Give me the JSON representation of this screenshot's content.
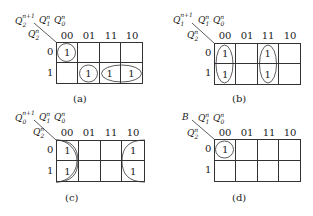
{
  "diagrams": [
    {
      "id": "a",
      "caption": "(a)",
      "output_var": "Q",
      "output_sub": "2",
      "output_sup": "n+1",
      "col_var": "Q",
      "col_sub1": "1",
      "col_sup1": "n",
      "col_sub2": "0",
      "col_sup2": "n",
      "row_var": "Q",
      "row_sub": "2",
      "row_sup": "n",
      "col_headers": [
        "00",
        "01",
        "11",
        "10"
      ],
      "row_headers": [
        "0",
        "1"
      ],
      "cells": [
        [
          "1",
          "",
          "",
          ""
        ],
        [
          "",
          "1",
          "1",
          "1"
        ]
      ],
      "groups": [
        "m0 circle",
        "row1 col01 circle",
        "row1 cols 11-10 ellipse"
      ]
    },
    {
      "id": "b",
      "caption": "(b)",
      "output_var": "Q",
      "output_sub": "1",
      "output_sup": "n+1",
      "col_var": "Q",
      "col_sub1": "1",
      "col_sup1": "n",
      "col_sub2": "0",
      "col_sup2": "n",
      "row_var": "Q",
      "row_sub": "2",
      "row_sup": "n",
      "col_headers": [
        "00",
        "01",
        "11",
        "10"
      ],
      "row_headers": [
        "0",
        "1"
      ],
      "cells": [
        [
          "1",
          "",
          "1",
          ""
        ],
        [
          "1",
          "",
          "1",
          ""
        ]
      ],
      "groups": [
        "col 00 vertical ellipse",
        "col 11 vertical ellipse"
      ]
    },
    {
      "id": "c",
      "caption": "(c)",
      "output_var": "Q",
      "output_sub": "0",
      "output_sup": "n+1",
      "col_var": "Q",
      "col_sub1": "1",
      "col_sup1": "n",
      "col_sub2": "0",
      "col_sup2": "n",
      "row_var": "Q",
      "row_sub": "2",
      "row_sup": "n",
      "col_headers": [
        "00",
        "01",
        "11",
        "10"
      ],
      "row_headers": [
        "0",
        "1"
      ],
      "cells": [
        [
          "1",
          "",
          "",
          "1"
        ],
        [
          "1",
          "",
          "",
          "1"
        ]
      ],
      "groups": [
        "wrap-around cols 00 and 10 half-ellipses"
      ]
    },
    {
      "id": "d",
      "caption": "(d)",
      "output_var": "B",
      "output_sub": "",
      "output_sup": "",
      "col_var": "Q",
      "col_sub1": "1",
      "col_sup1": "n",
      "col_sub2": "0",
      "col_sup2": "n",
      "row_var": "Q",
      "row_sub": "2",
      "row_sup": "n",
      "col_headers": [
        "00",
        "01",
        "11",
        "10"
      ],
      "row_headers": [
        "0",
        "1"
      ],
      "cells": [
        [
          "1",
          "",
          "",
          ""
        ],
        [
          "",
          "",
          "",
          ""
        ]
      ],
      "groups": [
        "m0 circle"
      ]
    }
  ]
}
